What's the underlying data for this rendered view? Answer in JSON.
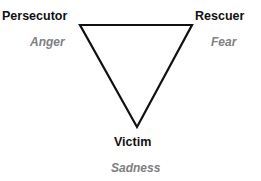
{
  "diagram": {
    "nodes": [
      {
        "role": "Persecutor",
        "emotion": "Anger"
      },
      {
        "role": "Rescuer",
        "emotion": "Fear"
      },
      {
        "role": "Victim",
        "emotion": "Sadness"
      }
    ],
    "colors": {
      "line": "#111111",
      "role_text": "#111111",
      "emotion_text": "#808080"
    }
  }
}
